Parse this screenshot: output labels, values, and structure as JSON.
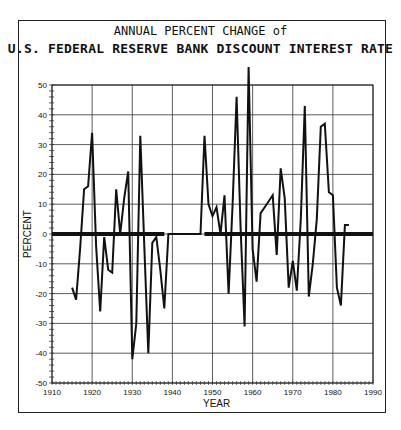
{
  "chart_data": {
    "type": "line",
    "title": "ANNUAL PERCENT CHANGE of",
    "subtitle": "U.S. FEDERAL RESERVE BANK DISCOUNT INTEREST RATE",
    "xlabel": "YEAR",
    "ylabel": "PERCENT",
    "xlim": [
      1910,
      1990
    ],
    "ylim": [
      -50,
      50
    ],
    "xticks": [
      1910,
      1920,
      1930,
      1940,
      1950,
      1960,
      1970,
      1980,
      1990
    ],
    "yticks": [
      -50,
      -40,
      -30,
      -20,
      -10,
      0,
      10,
      20,
      30,
      40,
      50
    ],
    "grid": true,
    "zero_line_segments": [
      [
        1910,
        1938
      ],
      [
        1948,
        1990
      ]
    ],
    "series": [
      {
        "name": "Annual percent change",
        "x": [
          1915,
          1916,
          1917,
          1918,
          1919,
          1920,
          1921,
          1922,
          1923,
          1924,
          1925,
          1926,
          1927,
          1928,
          1929,
          1930,
          1931,
          1932,
          1933,
          1934,
          1935,
          1936,
          1937,
          1938,
          1939,
          1940,
          1941,
          1942,
          1943,
          1944,
          1945,
          1946,
          1947,
          1948,
          1949,
          1950,
          1951,
          1952,
          1953,
          1954,
          1955,
          1956,
          1957,
          1958,
          1959,
          1960,
          1961,
          1962,
          1963,
          1964,
          1965,
          1966,
          1967,
          1968,
          1969,
          1970,
          1971,
          1972,
          1973,
          1974,
          1975,
          1976,
          1977,
          1978,
          1979,
          1980,
          1981,
          1982,
          1983,
          1984
        ],
        "values": [
          -18,
          -22,
          -5,
          15,
          16,
          34,
          -4,
          -26,
          -1,
          -12,
          -13,
          15,
          0,
          12,
          21,
          -42,
          -30,
          33,
          -4,
          -40,
          -3,
          -1,
          -12,
          -25,
          0,
          0,
          0,
          0,
          0,
          0,
          0,
          0,
          0,
          33,
          10,
          6,
          9,
          0,
          13,
          -20,
          10,
          46,
          2,
          -31,
          56,
          -5,
          -16,
          7,
          9,
          11,
          13,
          -7,
          22,
          12,
          -18,
          -9,
          -19,
          5,
          43,
          -21,
          -10,
          5,
          36,
          37,
          14,
          13,
          -18,
          -24,
          3,
          3
        ]
      }
    ]
  },
  "labels": {
    "title": "ANNUAL PERCENT CHANGE of",
    "subtitle": "U.S. FEDERAL RESERVE BANK DISCOUNT INTEREST RATE",
    "xlabel": "YEAR",
    "ylabel": "PERCENT"
  }
}
